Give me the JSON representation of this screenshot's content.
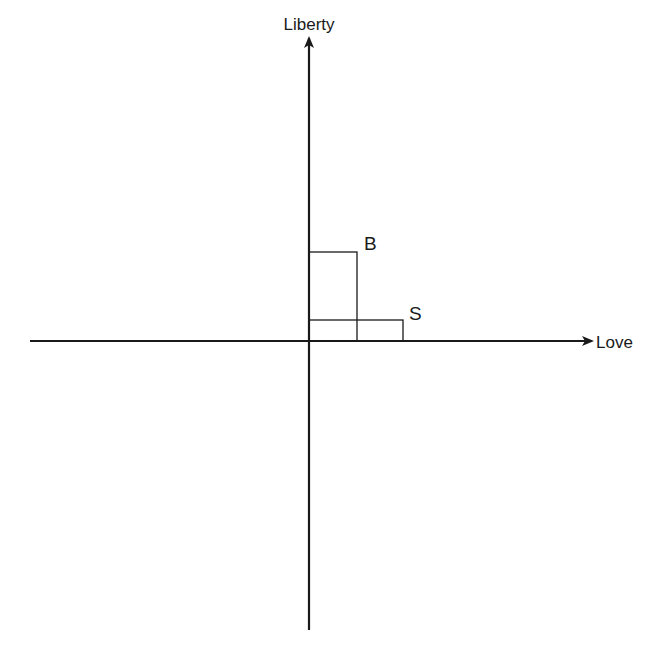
{
  "diagram": {
    "axes": {
      "x_label": "Love",
      "y_label": "Liberty"
    },
    "points": [
      {
        "label": "B",
        "love": 1,
        "liberty": 2
      },
      {
        "label": "S",
        "love": 2,
        "liberty": 0.45
      }
    ],
    "colors": {
      "ink": "#1a1a1a",
      "background": "#ffffff"
    }
  }
}
